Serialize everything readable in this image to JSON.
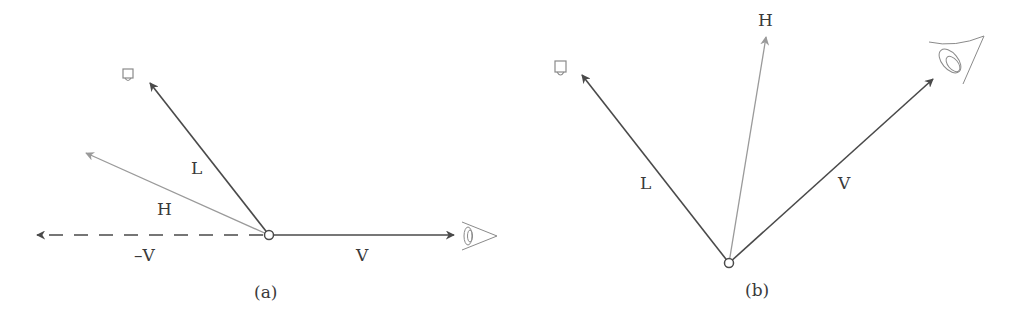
{
  "colors": {
    "dark_vector": "#4a4a4a",
    "light_vector": "#9a9a9a",
    "icon_stroke": "#8a8a8a",
    "text": "#3a3a3a",
    "background": "#ffffff"
  },
  "panels": [
    {
      "id": "a",
      "caption": "(a)",
      "labels": {
        "L": "L",
        "H": "H",
        "V": "V",
        "negV": "–V"
      },
      "icons": [
        "light-source-icon",
        "eye-icon"
      ],
      "vectors": [
        {
          "name": "L",
          "style": "solid-dark",
          "from": [
            269,
            235
          ],
          "to": [
            148,
            80
          ]
        },
        {
          "name": "H",
          "style": "solid-light",
          "from": [
            269,
            235
          ],
          "to": [
            83,
            152
          ]
        },
        {
          "name": "-V",
          "style": "dashed-dark",
          "from": [
            269,
            235
          ],
          "to": [
            35,
            235
          ]
        },
        {
          "name": "V",
          "style": "solid-dark",
          "from": [
            269,
            235
          ],
          "to": [
            456,
            235
          ]
        }
      ]
    },
    {
      "id": "b",
      "caption": "(b)",
      "labels": {
        "L": "L",
        "H": "H",
        "V": "V"
      },
      "icons": [
        "light-source-icon",
        "eye-icon"
      ],
      "vectors": [
        {
          "name": "L",
          "style": "solid-dark",
          "from": [
            729,
            263
          ],
          "to": [
            580,
            73
          ]
        },
        {
          "name": "H",
          "style": "solid-light",
          "from": [
            729,
            263
          ],
          "to": [
            766,
            35
          ]
        },
        {
          "name": "V",
          "style": "solid-dark",
          "from": [
            729,
            263
          ],
          "to": [
            935,
            77
          ]
        }
      ]
    }
  ]
}
